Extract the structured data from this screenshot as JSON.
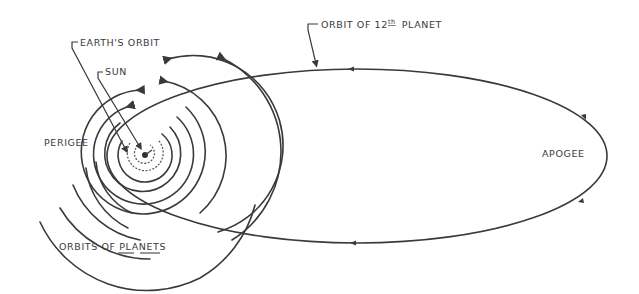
{
  "diagram": {
    "type": "orbital-diagram",
    "labels": {
      "earths_orbit": "EARTH'S ORBIT",
      "sun": "SUN",
      "perigee": "PERIGEE",
      "apogee": "APOGEE",
      "orbit_12th_prefix": "ORBIT OF 12",
      "orbit_12th_sup": "th",
      "orbit_12th_suffix": "PLANET",
      "orbits_of_planets": "ORBITS OF PLANETS"
    },
    "colors": {
      "ink": "#3a3a3a",
      "background": "#ffffff"
    },
    "geometry": {
      "sun_center": [
        145,
        155
      ],
      "planet_orbit_radii": [
        10,
        18,
        27,
        38,
        50,
        62,
        76,
        90,
        104
      ],
      "ellipse_center": [
        357,
        156
      ],
      "ellipse_rx": 250,
      "ellipse_ry": 87
    }
  }
}
